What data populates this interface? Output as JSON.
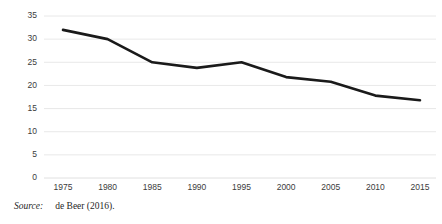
{
  "figure": {
    "source_label": "Source:",
    "source_text": "de Beer (2016)."
  },
  "chart_data": {
    "type": "line",
    "title": "",
    "subtitle": "",
    "xlabel": "",
    "ylabel": "",
    "categories": [
      "1975",
      "1980",
      "1985",
      "1990",
      "1995",
      "2000",
      "2005",
      "2010",
      "2015"
    ],
    "x": [
      1975,
      1980,
      1985,
      1990,
      1995,
      2000,
      2005,
      2010,
      2015
    ],
    "values": [
      32.0,
      30.0,
      25.0,
      23.8,
      25.0,
      21.8,
      20.8,
      17.8,
      16.8
    ],
    "series": [
      {
        "name": "",
        "values": [
          32.0,
          30.0,
          25.0,
          23.8,
          25.0,
          21.8,
          20.8,
          17.8,
          16.8
        ]
      }
    ],
    "ylim": [
      0,
      35
    ],
    "yticks": [
      0,
      5,
      10,
      15,
      20,
      25,
      30,
      35
    ],
    "ytick_labels": [
      "0",
      "5",
      "10",
      "15",
      "20",
      "25",
      "30",
      "35"
    ],
    "xtick_labels": [
      "1975",
      "1980",
      "1985",
      "1990",
      "1995",
      "2000",
      "2005",
      "2010",
      "2015"
    ],
    "grid": true,
    "grid_axis": "y",
    "legend": false,
    "legend_position": "none",
    "line_color": "#1a1a1a",
    "grid_color": "#e2e2e2",
    "background_color": "#ffffff"
  }
}
